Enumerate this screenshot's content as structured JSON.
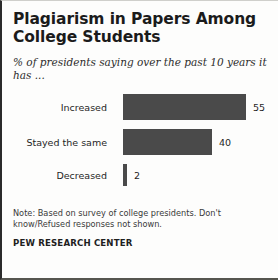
{
  "chart_data": {
    "type": "bar",
    "orientation": "horizontal",
    "title": "Plagiarism in Papers Among College Students",
    "subtitle": "% of presidents saying over the past 10 years it has ...",
    "categories": [
      "Increased",
      "Stayed the same",
      "Decreased"
    ],
    "values": [
      55,
      40,
      2
    ],
    "value_labels": [
      "55",
      "40",
      "2"
    ],
    "xlabel": "",
    "ylabel": "",
    "xlim": [
      0,
      55
    ],
    "grid": false,
    "legend": false,
    "bar_color": "#4a4a4a",
    "note": "Note: Based on survey of college presidents. Don't know/Refused responses not shown.",
    "source": "PEW RESEARCH CENTER"
  }
}
